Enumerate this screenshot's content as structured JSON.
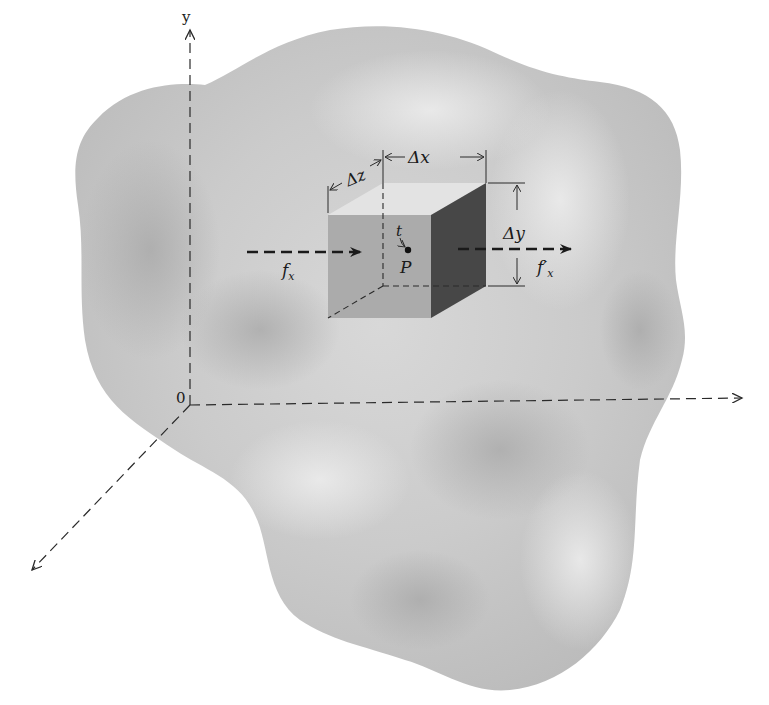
{
  "figure": {
    "colors": {
      "background": "#ffffff",
      "body_fill": "#c9c9c9",
      "body_highlight": "#e6e6e6",
      "cube_front": "#a8a8a8",
      "cube_top": "#e2e2e2",
      "cube_side": "#4a4a4a",
      "lines": "#2a2a2a"
    }
  },
  "axes": {
    "y_label": "y",
    "origin_label": "0"
  },
  "cube": {
    "dx_label": "Δx",
    "dy_label": "Δy",
    "dz_label": "Δz",
    "point_label": "P",
    "time_label": "t"
  },
  "flux": {
    "in_label_base": "f",
    "in_label_sub": "x",
    "out_label_base": "f′",
    "out_label_sub": "x"
  }
}
